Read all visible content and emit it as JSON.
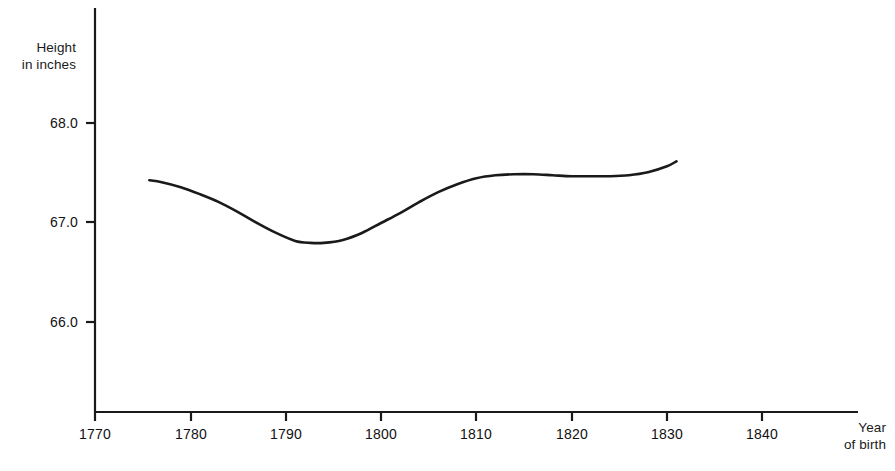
{
  "chart_data": {
    "type": "line",
    "title": "",
    "subtitle": "",
    "xlabel": "Year of birth",
    "ylabel": "Height in inches",
    "ylabel_line1": "Height",
    "ylabel_line2": "in inches",
    "xlabel_line1": "Year",
    "xlabel_line2": "of birth",
    "xlim": [
      1770,
      1848
    ],
    "ylim": [
      65.4,
      69.15
    ],
    "xticks": [
      1770,
      1780,
      1790,
      1800,
      1810,
      1820,
      1830,
      1840
    ],
    "xtick_labels": [
      "1770",
      "1780",
      "1790",
      "1800",
      "1810",
      "1820",
      "1830",
      "1840"
    ],
    "yticks": [
      66.0,
      67.0,
      68.0
    ],
    "ytick_labels": [
      "66.0",
      "67.0",
      "68.0"
    ],
    "grid": false,
    "legend": false,
    "legend_position": "none",
    "line_color": "#1a1a1a",
    "line_width": 2.6,
    "series": [
      {
        "name": "Mean height",
        "x": [
          1775.7,
          1777.0,
          1779.0,
          1781.0,
          1783.0,
          1785.0,
          1787.0,
          1789.0,
          1791.0,
          1792.6,
          1794.0,
          1796.0,
          1798.0,
          1800.0,
          1802.0,
          1804.0,
          1806.0,
          1808.0,
          1810.0,
          1812.0,
          1814.0,
          1816.0,
          1818.0,
          1820.0,
          1822.0,
          1824.0,
          1826.0,
          1828.0,
          1830.0,
          1831.0
        ],
        "values": [
          67.42,
          67.4,
          67.35,
          67.28,
          67.2,
          67.1,
          66.99,
          66.89,
          66.81,
          66.79,
          66.79,
          66.82,
          66.89,
          66.99,
          67.09,
          67.2,
          67.3,
          67.38,
          67.44,
          67.47,
          67.48,
          67.48,
          67.47,
          67.46,
          67.46,
          67.46,
          67.47,
          67.5,
          67.56,
          67.61
        ]
      }
    ]
  },
  "axes": {
    "y_axis_name": "height-axis",
    "x_axis_name": "year-axis"
  }
}
